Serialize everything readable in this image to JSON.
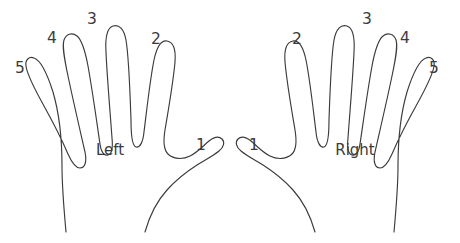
{
  "figure": {
    "background_color": "#ffffff",
    "stroke_color": "#3b3b3b",
    "text_color": "#3b3b3b"
  },
  "hands": [
    {
      "id": "left-hand",
      "caption": "Left",
      "caption_x": 110,
      "caption_y": 155,
      "digits": [
        {
          "name": "thumb",
          "label": "1",
          "x": 201,
          "y": 150
        },
        {
          "name": "index",
          "label": "2",
          "x": 156,
          "y": 44
        },
        {
          "name": "middle",
          "label": "3",
          "x": 92,
          "y": 24
        },
        {
          "name": "ring",
          "label": "4",
          "x": 52,
          "y": 43
        },
        {
          "name": "little",
          "label": "5",
          "x": 20,
          "y": 73
        }
      ]
    },
    {
      "id": "right-hand",
      "caption": "Right",
      "caption_x": 355,
      "caption_y": 155,
      "digits": [
        {
          "name": "thumb",
          "label": "1",
          "x": 254,
          "y": 150
        },
        {
          "name": "index",
          "label": "2",
          "x": 297,
          "y": 44
        },
        {
          "name": "middle",
          "label": "3",
          "x": 367,
          "y": 24
        },
        {
          "name": "ring",
          "label": "4",
          "x": 405,
          "y": 43
        },
        {
          "name": "little",
          "label": "5",
          "x": 434,
          "y": 73
        }
      ]
    }
  ]
}
